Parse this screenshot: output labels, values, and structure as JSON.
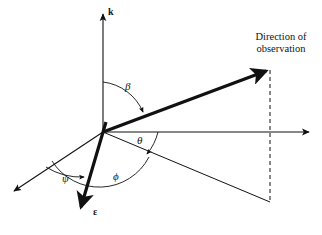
{
  "figure": {
    "background_color": "#ffffff",
    "stroke_color": "#111111",
    "labels": {
      "k_axis": "k",
      "epsilon_vector": "ε",
      "angle_beta": "β",
      "angle_theta": "θ",
      "angle_phi": "ϕ",
      "angle_psi": "ψ",
      "observation_line1": "Direction of",
      "observation_line2": "observation"
    }
  },
  "geometry": {
    "origin": {
      "x": 103,
      "y": 132
    },
    "vectors": [
      {
        "name": "k-axis",
        "style": "thin-arrow",
        "from": {
          "x": 103,
          "y": 132
        },
        "to": {
          "x": 103,
          "y": 13
        },
        "label": "k"
      },
      {
        "name": "horizontal-axis",
        "style": "thin-arrow",
        "from": {
          "x": 103,
          "y": 132
        },
        "to": {
          "x": 310,
          "y": 132
        },
        "label": ""
      },
      {
        "name": "lower-left-axis",
        "style": "thin-arrow",
        "from": {
          "x": 103,
          "y": 132
        },
        "to": {
          "x": 12,
          "y": 192
        },
        "label": ""
      },
      {
        "name": "observation-direction",
        "style": "thick-arrow",
        "from": {
          "x": 103,
          "y": 132
        },
        "to": {
          "x": 269,
          "y": 70
        },
        "label": "Direction of observation"
      },
      {
        "name": "epsilon-vector",
        "style": "thick-arrow",
        "from": {
          "x": 103,
          "y": 132
        },
        "to": {
          "x": 80,
          "y": 211
        },
        "label": "ε"
      },
      {
        "name": "projection-line",
        "style": "thin-line",
        "from": {
          "x": 103,
          "y": 132
        },
        "to": {
          "x": 270,
          "y": 202
        },
        "label": ""
      },
      {
        "name": "dashed-drop-line",
        "style": "dashed",
        "from": {
          "x": 270,
          "y": 70
        },
        "to": {
          "x": 270,
          "y": 202
        },
        "label": ""
      }
    ],
    "arcs": [
      {
        "name": "beta-arc",
        "label": "β",
        "between": [
          "k-axis",
          "observation-direction"
        ],
        "arrowhead_at": {
          "x": 146,
          "y": 114
        }
      },
      {
        "name": "theta-arc",
        "label": "θ",
        "between": [
          "horizontal-axis",
          "projection-line"
        ],
        "arrowhead_at": {
          "x": 146,
          "y": 155
        }
      },
      {
        "name": "phi-arc",
        "label": "ϕ",
        "between": [
          "projection-line",
          "epsilon-vector"
        ],
        "arrowhead_at": {
          "x": 148,
          "y": 156
        }
      },
      {
        "name": "psi-arc",
        "label": "ψ",
        "between": [
          "lower-left-axis",
          "epsilon-vector"
        ],
        "arrowhead_at": {
          "x": 86,
          "y": 178
        }
      }
    ]
  }
}
